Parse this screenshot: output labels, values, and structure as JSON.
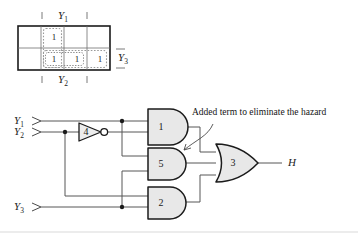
{
  "figure": {
    "background_color": "#ffffff",
    "line_color": "#1b1b1b",
    "gate_fill_color": "#e8e8e8",
    "dotted_group_color": "#9a9a9a"
  },
  "kmap": {
    "name": "karnaugh-map",
    "rows": 2,
    "columns": 4,
    "top_label": "Y",
    "top_label_sub": "1",
    "bottom_label": "Y",
    "bottom_label_sub": "2",
    "right_label": "Y",
    "right_label_sub": "3",
    "cells": [
      {
        "row": 0,
        "col": 0,
        "value": ""
      },
      {
        "row": 0,
        "col": 1,
        "value": "1"
      },
      {
        "row": 0,
        "col": 2,
        "value": ""
      },
      {
        "row": 0,
        "col": 3,
        "value": ""
      },
      {
        "row": 1,
        "col": 0,
        "value": ""
      },
      {
        "row": 1,
        "col": 1,
        "value": "1"
      },
      {
        "row": 1,
        "col": 2,
        "value": "1"
      },
      {
        "row": 1,
        "col": 3,
        "value": "1"
      }
    ],
    "groups": [
      {
        "id": "group-vertical",
        "label": "vertical-prime-implicant"
      },
      {
        "id": "group-horizontal",
        "label": "horizontal-prime-implicant"
      },
      {
        "id": "group-added",
        "label": "added-consensus-term"
      }
    ]
  },
  "circuit": {
    "inputs": [
      {
        "id": "input-y1",
        "label": "Y",
        "sub": "1"
      },
      {
        "id": "input-y2",
        "label": "Y",
        "sub": "2"
      },
      {
        "id": "input-y3",
        "label": "Y",
        "sub": "3"
      }
    ],
    "inverter": {
      "id": "inverter-4",
      "number": "4",
      "type": "NOT"
    },
    "and_gates": [
      {
        "id": "and-gate-1",
        "number": "1",
        "type": "AND"
      },
      {
        "id": "and-gate-5",
        "number": "5",
        "type": "AND"
      },
      {
        "id": "and-gate-2",
        "number": "2",
        "type": "AND"
      }
    ],
    "or_gate": {
      "id": "or-gate-3",
      "number": "3",
      "type": "OR"
    },
    "output": {
      "id": "output-h",
      "label": "H"
    },
    "annotation": {
      "id": "hazard-annotation",
      "text": "Added term to eliminate the hazard"
    }
  }
}
